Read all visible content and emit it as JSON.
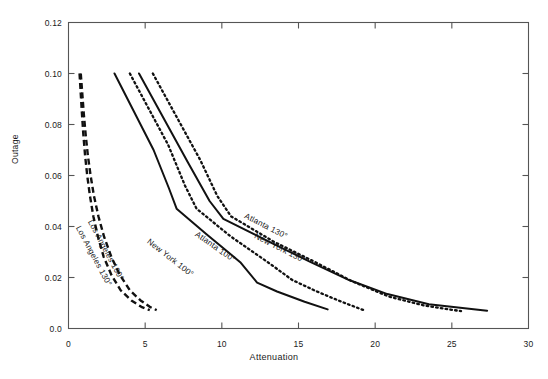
{
  "chart_data": {
    "type": "line",
    "title": "",
    "xlabel": "Attenuation",
    "ylabel": "Outage",
    "xlim": [
      0,
      30
    ],
    "ylim": [
      0,
      0.12
    ],
    "xticks": [
      0,
      5,
      10,
      15,
      20,
      25,
      30
    ],
    "xtick_labels": [
      "0",
      "5",
      "10",
      "15",
      "20",
      "25",
      "30"
    ],
    "yticks": [
      0.0,
      0.02,
      0.04,
      0.06,
      0.08,
      0.1,
      0.12
    ],
    "ytick_labels": [
      "0.0",
      "0.02",
      "0.04",
      "0.06",
      "0.08",
      "0.10",
      "0.12"
    ],
    "grid": false,
    "legend": "inline-curve-labels",
    "series": [
      {
        "name": "Los Angeles 100°",
        "style": "dashed",
        "points": [
          [
            0.72,
            0.1
          ],
          [
            0.8,
            0.092
          ],
          [
            0.88,
            0.084
          ],
          [
            0.97,
            0.076
          ],
          [
            1.08,
            0.068
          ],
          [
            1.22,
            0.06
          ],
          [
            1.4,
            0.052
          ],
          [
            1.62,
            0.044
          ],
          [
            1.92,
            0.036
          ],
          [
            2.3,
            0.028
          ],
          [
            2.8,
            0.021
          ],
          [
            3.4,
            0.015
          ],
          [
            4.1,
            0.011
          ],
          [
            4.75,
            0.0085
          ],
          [
            5.3,
            0.0072
          ]
        ]
      },
      {
        "name": "Los Angeles 130°",
        "style": "dashed",
        "points": [
          [
            0.8,
            0.1
          ],
          [
            0.9,
            0.092
          ],
          [
            1.0,
            0.084
          ],
          [
            1.12,
            0.076
          ],
          [
            1.26,
            0.068
          ],
          [
            1.44,
            0.06
          ],
          [
            1.66,
            0.052
          ],
          [
            1.95,
            0.044
          ],
          [
            2.32,
            0.036
          ],
          [
            2.8,
            0.028
          ],
          [
            3.35,
            0.021
          ],
          [
            4.0,
            0.015
          ],
          [
            4.7,
            0.011
          ],
          [
            5.3,
            0.0085
          ],
          [
            5.75,
            0.0072
          ]
        ]
      },
      {
        "name": "New York 100°",
        "style": "solid",
        "points": [
          [
            3.0,
            0.1
          ],
          [
            5.55,
            0.07
          ],
          [
            6.55,
            0.055
          ],
          [
            7.05,
            0.047
          ],
          [
            9.0,
            0.037
          ],
          [
            11.2,
            0.026
          ],
          [
            12.3,
            0.018
          ],
          [
            13.6,
            0.0145
          ],
          [
            15.4,
            0.0105
          ],
          [
            16.9,
            0.0075
          ]
        ]
      },
      {
        "name": "Atlanta 100°",
        "style": "dotted",
        "points": [
          [
            4.0,
            0.1
          ],
          [
            6.5,
            0.072
          ],
          [
            7.6,
            0.056
          ],
          [
            8.35,
            0.047
          ],
          [
            10.6,
            0.036
          ],
          [
            13.0,
            0.026
          ],
          [
            14.6,
            0.019
          ],
          [
            16.2,
            0.0145
          ],
          [
            17.8,
            0.0105
          ],
          [
            19.25,
            0.0072
          ]
        ]
      },
      {
        "name": "New York 130°",
        "style": "solid",
        "points": [
          [
            4.6,
            0.1
          ],
          [
            7.8,
            0.065
          ],
          [
            9.2,
            0.05
          ],
          [
            10.1,
            0.043
          ],
          [
            13.1,
            0.034
          ],
          [
            15.8,
            0.026
          ],
          [
            18.3,
            0.019
          ],
          [
            20.8,
            0.0135
          ],
          [
            23.5,
            0.0095
          ],
          [
            27.3,
            0.007
          ]
        ]
      },
      {
        "name": "Atlanta 130°",
        "style": "dotted",
        "points": [
          [
            5.5,
            0.1
          ],
          [
            8.6,
            0.066
          ],
          [
            9.7,
            0.052
          ],
          [
            10.6,
            0.044
          ],
          [
            13.4,
            0.034
          ],
          [
            16.1,
            0.026
          ],
          [
            18.5,
            0.0185
          ],
          [
            20.9,
            0.0125
          ],
          [
            23.2,
            0.009
          ],
          [
            25.6,
            0.0068
          ]
        ]
      }
    ],
    "annotations": [
      {
        "text": "Los Angeles 100°",
        "x": 90,
        "y": 216,
        "angle": 62
      },
      {
        "text": "Los Angeles 130°",
        "x": 78,
        "y": 222,
        "angle": 62
      },
      {
        "text": "New York 100°",
        "x": 148,
        "y": 236,
        "angle": 38
      },
      {
        "text": "Atlanta 100°",
        "x": 196,
        "y": 229,
        "angle": 35
      },
      {
        "text": "New York 130°",
        "x": 255,
        "y": 231,
        "angle": 27
      },
      {
        "text": "Atlanta 130°",
        "x": 245,
        "y": 211,
        "angle": 27
      }
    ]
  },
  "axes": {
    "frame_color": "#555555",
    "line_color": "#111111"
  }
}
